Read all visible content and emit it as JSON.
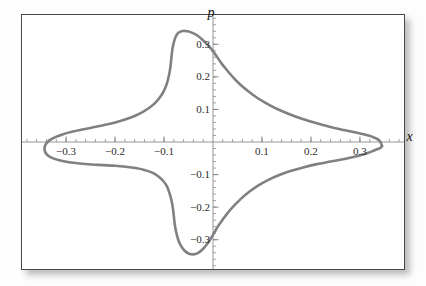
{
  "figure": {
    "background_color": "#ffffff",
    "frame_color": "#4a4a4a",
    "curve_color": "#808080",
    "axis_color": "#8a8a8a"
  },
  "axis_names": {
    "x": "x",
    "y": "p"
  },
  "chart_data": {
    "type": "line",
    "title": "",
    "subtitle": "",
    "xlabel": "x",
    "ylabel": "p",
    "xlim": [
      -0.39,
      0.39
    ],
    "ylim": [
      -0.39,
      0.39
    ],
    "grid": false,
    "legend": "none",
    "xticks": [
      -0.3,
      -0.2,
      -0.1,
      0.1,
      0.2,
      0.3
    ],
    "xtick_labels": [
      "-0.3",
      "-0.2",
      "-0.1",
      "0.1",
      "0.2",
      "0.3"
    ],
    "yticks": [
      0.3,
      0.2,
      0.1,
      -0.1,
      -0.2,
      -0.3
    ],
    "ytick_labels": [
      "0.3",
      "0.2",
      "0.1",
      "-0.1",
      "-0.2",
      "-0.3"
    ],
    "minor_ticks": true,
    "annotations": [],
    "series": [
      {
        "name": "separatrix",
        "closed": true,
        "color": "#808080",
        "linewidth": 2.6,
        "points": [
          [
            0.345,
            -0.012
          ],
          [
            0.34,
            0.004
          ],
          [
            0.325,
            0.016
          ],
          [
            0.3,
            0.026
          ],
          [
            0.27,
            0.036
          ],
          [
            0.24,
            0.046
          ],
          [
            0.21,
            0.058
          ],
          [
            0.18,
            0.072
          ],
          [
            0.155,
            0.086
          ],
          [
            0.13,
            0.102
          ],
          [
            0.11,
            0.118
          ],
          [
            0.09,
            0.136
          ],
          [
            0.072,
            0.156
          ],
          [
            0.056,
            0.176
          ],
          [
            0.042,
            0.197
          ],
          [
            0.03,
            0.218
          ],
          [
            0.018,
            0.24
          ],
          [
            0.008,
            0.262
          ],
          [
            -0.002,
            0.283
          ],
          [
            -0.012,
            0.3
          ],
          [
            -0.022,
            0.315
          ],
          [
            -0.032,
            0.327
          ],
          [
            -0.042,
            0.335
          ],
          [
            -0.052,
            0.34
          ],
          [
            -0.062,
            0.341
          ],
          [
            -0.07,
            0.336
          ],
          [
            -0.076,
            0.324
          ],
          [
            -0.08,
            0.306
          ],
          [
            -0.083,
            0.284
          ],
          [
            -0.085,
            0.258
          ],
          [
            -0.087,
            0.23
          ],
          [
            -0.09,
            0.204
          ],
          [
            -0.094,
            0.18
          ],
          [
            -0.1,
            0.158
          ],
          [
            -0.108,
            0.138
          ],
          [
            -0.118,
            0.12
          ],
          [
            -0.13,
            0.105
          ],
          [
            -0.144,
            0.092
          ],
          [
            -0.16,
            0.08
          ],
          [
            -0.178,
            0.07
          ],
          [
            -0.198,
            0.061
          ],
          [
            -0.22,
            0.053
          ],
          [
            -0.242,
            0.046
          ],
          [
            -0.264,
            0.039
          ],
          [
            -0.286,
            0.032
          ],
          [
            -0.306,
            0.024
          ],
          [
            -0.322,
            0.015
          ],
          [
            -0.334,
            0.005
          ],
          [
            -0.342,
            -0.008
          ],
          [
            -0.344,
            -0.023
          ],
          [
            -0.34,
            -0.037
          ],
          [
            -0.33,
            -0.048
          ],
          [
            -0.314,
            -0.056
          ],
          [
            -0.294,
            -0.062
          ],
          [
            -0.272,
            -0.066
          ],
          [
            -0.248,
            -0.069
          ],
          [
            -0.224,
            -0.071
          ],
          [
            -0.2,
            -0.073
          ],
          [
            -0.178,
            -0.076
          ],
          [
            -0.158,
            -0.08
          ],
          [
            -0.14,
            -0.086
          ],
          [
            -0.124,
            -0.094
          ],
          [
            -0.112,
            -0.105
          ],
          [
            -0.102,
            -0.119
          ],
          [
            -0.094,
            -0.136
          ],
          [
            -0.089,
            -0.156
          ],
          [
            -0.085,
            -0.178
          ],
          [
            -0.082,
            -0.202
          ],
          [
            -0.08,
            -0.228
          ],
          [
            -0.078,
            -0.254
          ],
          [
            -0.075,
            -0.278
          ],
          [
            -0.071,
            -0.3
          ],
          [
            -0.065,
            -0.32
          ],
          [
            -0.058,
            -0.334
          ],
          [
            -0.049,
            -0.343
          ],
          [
            -0.04,
            -0.345
          ],
          [
            -0.031,
            -0.341
          ],
          [
            -0.022,
            -0.331
          ],
          [
            -0.014,
            -0.317
          ],
          [
            -0.006,
            -0.3
          ],
          [
            0.002,
            -0.28
          ],
          [
            0.01,
            -0.259
          ],
          [
            0.02,
            -0.238
          ],
          [
            0.031,
            -0.216
          ],
          [
            0.044,
            -0.194
          ],
          [
            0.058,
            -0.173
          ],
          [
            0.074,
            -0.153
          ],
          [
            0.092,
            -0.134
          ],
          [
            0.112,
            -0.117
          ],
          [
            0.134,
            -0.102
          ],
          [
            0.158,
            -0.089
          ],
          [
            0.184,
            -0.078
          ],
          [
            0.212,
            -0.068
          ],
          [
            0.24,
            -0.06
          ],
          [
            0.268,
            -0.052
          ],
          [
            0.294,
            -0.044
          ],
          [
            0.316,
            -0.034
          ],
          [
            0.332,
            -0.024
          ],
          [
            0.342,
            -0.018
          ],
          [
            0.345,
            -0.012
          ]
        ]
      }
    ]
  }
}
